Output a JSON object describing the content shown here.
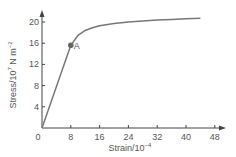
{
  "chart_data": {
    "type": "line",
    "title": "",
    "xlabel": "Strain/10",
    "xlabel_exp": "−4",
    "ylabel": "Stress/10",
    "ylabel_exp": "7",
    "ylabel_unit": " N m",
    "ylabel_unit_exp": "−2",
    "xlim": [
      0,
      50
    ],
    "ylim": [
      0,
      22
    ],
    "x_ticks": [
      "0",
      "8",
      "16",
      "24",
      "32",
      "40",
      "48"
    ],
    "y_ticks": [
      "4",
      "8",
      "12",
      "16",
      "20"
    ],
    "grid": false,
    "series": [
      {
        "name": "stress-strain curve",
        "x": [
          0,
          8,
          10,
          12,
          14,
          16,
          20,
          24,
          28,
          32,
          36,
          40,
          44
        ],
        "y": [
          0,
          15.6,
          17.5,
          18.4,
          18.9,
          19.3,
          19.7,
          20.0,
          20.2,
          20.4,
          20.5,
          20.6,
          20.7
        ]
      }
    ],
    "annotations": [
      {
        "label": "A",
        "x": 8,
        "y": 15.6
      }
    ],
    "colors": {
      "curve": "#777777",
      "axis": "#444444",
      "point": "#666666"
    }
  }
}
